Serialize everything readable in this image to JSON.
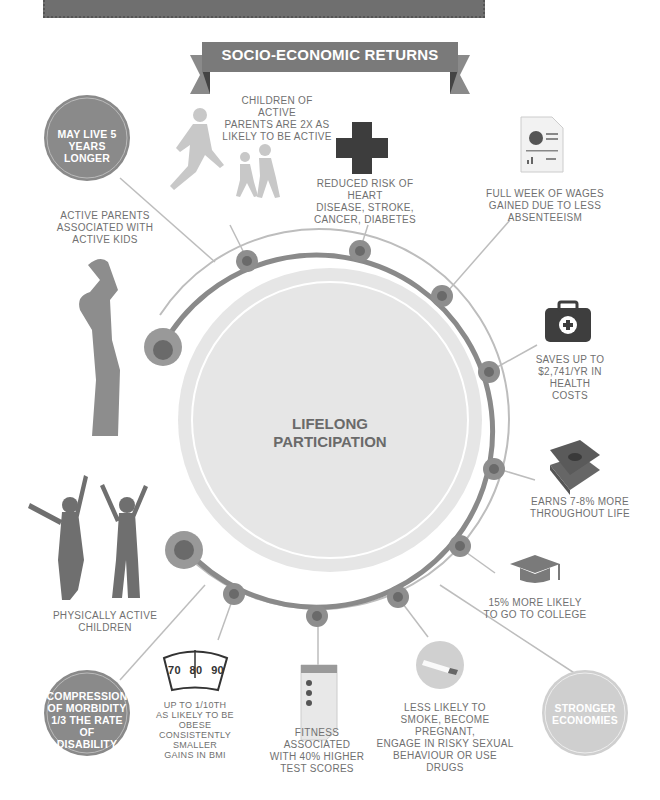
{
  "banner": {
    "title": "SOCIO-ECONOMIC RETURNS"
  },
  "center": {
    "line1": "LIFELONG",
    "line2": "PARTICIPATION"
  },
  "colors": {
    "ring": "#8a8a8a",
    "node_fill": "#8e8e8e",
    "node_inner": "#6a6a6a",
    "center_fill": "#e6e6e6",
    "banner": "#7a7a7a",
    "bubble_dark": "#8a8a8a",
    "bubble_light": "#cfcfcf",
    "text": "#707070"
  },
  "bubbles": [
    {
      "id": "live-longer",
      "lines": [
        "MAY LIVE 5",
        "YEARS LONGER"
      ]
    },
    {
      "id": "compression",
      "lines": [
        "COMPRESSION",
        "OF MORBIDITY",
        "1/3 THE RATE OF",
        "DISABILITY"
      ]
    },
    {
      "id": "stronger-economies",
      "lines": [
        "STRONGER",
        "ECONOMIES"
      ]
    }
  ],
  "labels": {
    "children_active": [
      "CHILDREN OF ACTIVE",
      "PARENTS ARE 2X AS",
      "LIKELY TO BE ACTIVE"
    ],
    "active_parents": [
      "ACTIVE PARENTS",
      "ASSOCIATED WITH",
      "ACTIVE KIDS"
    ],
    "reduced_risk": [
      "REDUCED RISK OF HEART",
      "DISEASE, STROKE,",
      "CANCER, DIABETES"
    ],
    "full_week": [
      "FULL WEEK OF WAGES",
      "GAINED DUE TO LESS",
      "ABSENTEEISM"
    ],
    "saves": [
      "SAVES UP TO",
      "$2,741/YR IN",
      "HEALTH",
      "COSTS"
    ],
    "earns": [
      "EARNS 7-8% MORE",
      "THROUGHOUT LIFE"
    ],
    "college": [
      "15% MORE LIKELY",
      "TO GO TO COLLEGE"
    ],
    "less_likely": [
      "LESS LIKELY TO",
      "SMOKE, BECOME PREGNANT,",
      "ENGAGE IN RISKY SEXUAL",
      "BEHAVIOUR OR USE DRUGS"
    ],
    "fitness": [
      "FITNESS ASSOCIATED",
      "WITH 40% HIGHER",
      "TEST SCORES"
    ],
    "obese": [
      "UP TO 1/10TH",
      "AS LIKELY TO BE OBESE",
      "CONSISTENTLY SMALLER",
      "GAINS IN BMI"
    ],
    "physically_active": [
      "PHYSICALLY ACTIVE",
      "CHILDREN"
    ]
  },
  "scale": {
    "ticks": [
      "70",
      "80",
      "90"
    ]
  },
  "icons": [
    "runner-family-icon",
    "medical-cross-icon",
    "report-document-icon",
    "first-aid-kit-icon",
    "money-stack-icon",
    "graduation-cap-icon",
    "cigarette-icon",
    "checklist-icon",
    "weight-scale-icon",
    "parent-child-icon",
    "children-icon"
  ]
}
